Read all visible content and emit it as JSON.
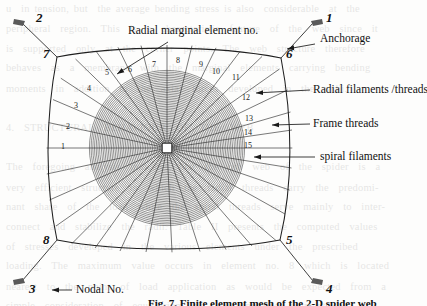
{
  "figure": {
    "caption": "Fig. 7.  Finite element mesh of the 2-D spider web",
    "background_color": "#fdfdfc",
    "line_color": "#1a1a1a"
  },
  "callouts": [
    {
      "key": "radial_marginal",
      "label": "Radial marginal element no.",
      "x": 128,
      "y": 31
    },
    {
      "key": "anchorage",
      "label": "Anchorage",
      "x": 318,
      "y": 39
    },
    {
      "key": "radial_filaments",
      "label": "Radial filaments /threads",
      "x": 311,
      "y": 86
    },
    {
      "key": "frame_threads",
      "label": "Frame threads",
      "x": 311,
      "y": 120
    },
    {
      "key": "spiral_filaments",
      "label": "spiral filaments",
      "x": 318,
      "y": 154
    },
    {
      "key": "nodal_no",
      "label": "Nodal No.",
      "x": 44,
      "y": 286
    }
  ],
  "nodes": [
    {
      "num": "1",
      "x": 328,
      "y": 17,
      "anchor_x": 316,
      "anchor_y": 21,
      "type": "anchorage"
    },
    {
      "num": "2",
      "x": 28,
      "y": 17,
      "anchor_x": 18,
      "anchor_y": 21,
      "type": "anchorage"
    },
    {
      "num": "3",
      "x": 28,
      "y": 288,
      "anchor_x": 18,
      "anchor_y": 283,
      "type": "anchorage"
    },
    {
      "num": "4",
      "x": 328,
      "y": 288,
      "anchor_x": 316,
      "anchor_y": 283,
      "type": "anchorage"
    },
    {
      "num": "5",
      "x": 289,
      "y": 243,
      "anchor_x": 280,
      "anchor_y": 240,
      "type": "frame-corner"
    },
    {
      "num": "6",
      "x": 289,
      "y": 56,
      "anchor_x": 281,
      "anchor_y": 58,
      "type": "frame-corner"
    },
    {
      "num": "7",
      "x": 46,
      "y": 56,
      "anchor_x": 57,
      "anchor_y": 57,
      "type": "frame-corner"
    },
    {
      "num": "8",
      "x": 46,
      "y": 243,
      "anchor_x": 57,
      "anchor_y": 240,
      "type": "frame-corner"
    }
  ],
  "radial_element_numbers": [
    {
      "num": "1",
      "x": 61,
      "y": 147
    },
    {
      "num": "2",
      "x": 66,
      "y": 127
    },
    {
      "num": "3",
      "x": 74,
      "y": 106
    },
    {
      "num": "4",
      "x": 87,
      "y": 89
    },
    {
      "num": "5",
      "x": 105,
      "y": 73
    },
    {
      "num": "6",
      "x": 128,
      "y": 70
    },
    {
      "num": "7",
      "x": 152,
      "y": 65
    },
    {
      "num": "8",
      "x": 176,
      "y": 61
    },
    {
      "num": "9",
      "x": 199,
      "y": 65
    },
    {
      "num": "10",
      "x": 214,
      "y": 72
    },
    {
      "num": "11",
      "x": 233,
      "y": 78
    },
    {
      "num": "12",
      "x": 243,
      "y": 98
    },
    {
      "num": "13",
      "x": 246,
      "y": 119
    },
    {
      "num": "14",
      "x": 245,
      "y": 133
    },
    {
      "num": "15",
      "x": 245,
      "y": 146
    }
  ],
  "hub": {
    "cx": 167,
    "cy": 148
  },
  "bleed_text": "u  in tension, but  the average bending stress is also  considerable  at  the\nperipheral  region.  This  is  a  characteristic  feature  of  the  web  since  it\nis  supported  only  at  the  corner  points.  The  web  structure  therefore\nbehaves  as  a  membrane  with  the  marginal  elements  carrying  bending\nmoments  in  addition  to  the  axial  forces  developed  in  the  radii.\n\n4.  STRUCTURAL  BEHAVIOUR  OF  THE  WEB\n\nThe  foregoing  analysis  indicates  that  the  orb  web  of  the  spider  is  a\nvery  efficient  structure  in  which  the  radial  threads  carry  the  predomi-\nnant  share  of  the  load  while  the  spiral  threads  serve  mainly  to  inter-\nconnect  and  stabilize  the  radii.  Table  II  presents  the  computed  values\nof  stresses  developed  in  the  various  elements  under  the  prescribed\nloading.  The  maximum  value  occurs  in  element  no.  8  which  is  located\nnearest  to  the  point  of  load  application  as  would  be  expected  from  a\nsimple  consideration  of  equilibrium  of  the  connected  filaments.\nAfter  a  certain  level  of  loading  the  outlying  spirals  fail  and  the  stress\nis  redistributed  among  the  remaining  threads."
}
